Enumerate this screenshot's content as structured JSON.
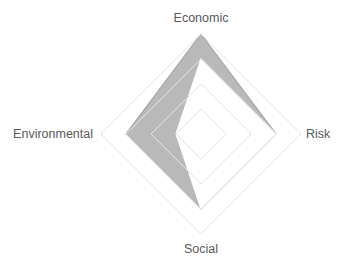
{
  "chart_data": {
    "type": "radar",
    "title": "",
    "axes": [
      "Economic",
      "Risk",
      "Social",
      "Environmental"
    ],
    "range": [
      0,
      4
    ],
    "grid_rings": 4,
    "grid": true,
    "legend": "none",
    "series": [
      {
        "name": "Series 1",
        "values": [
          4,
          3,
          3,
          3
        ],
        "fill": "#b9b9b9",
        "stroke": "#a6a6a6"
      },
      {
        "name": "Series 2",
        "values": [
          3,
          3,
          3,
          1
        ],
        "fill": "#ffffff",
        "stroke": "#ffffff"
      }
    ]
  }
}
